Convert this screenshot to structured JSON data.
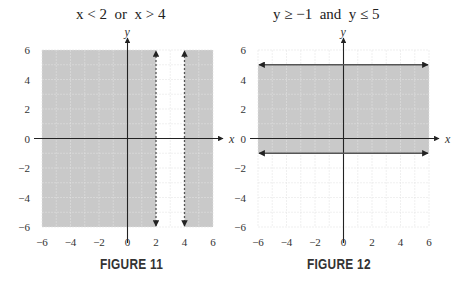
{
  "figures": [
    {
      "label": "FIGURE 11",
      "title": "x < 2  or  x > 4",
      "x_axis_label": "x",
      "y_axis_label": "y"
    },
    {
      "label": "FIGURE 12",
      "title": "y ≥ −1  and  y ≤ 5",
      "x_axis_label": "x",
      "y_axis_label": "y"
    }
  ],
  "tick_labels": {
    "x": [
      "−6",
      "−4",
      "−2",
      "0",
      "2",
      "4",
      "6"
    ],
    "y": [
      "6",
      "4",
      "2",
      "0",
      "−2",
      "−4",
      "−6"
    ]
  },
  "colors": {
    "shade": "#c9c9c9",
    "grid": "#e4e4e4",
    "axis": "#222222",
    "boundary": "#555555"
  },
  "chart_data": [
    {
      "type": "region",
      "title": "x < 2 or x > 4",
      "caption": "FIGURE 11",
      "xlabel": "x",
      "ylabel": "y",
      "xlim": [
        -6,
        6
      ],
      "ylim": [
        -6,
        6
      ],
      "xticks": [
        -6,
        -4,
        -2,
        0,
        2,
        4,
        6
      ],
      "yticks": [
        -6,
        -4,
        -2,
        0,
        2,
        4,
        6
      ],
      "grid": true,
      "shaded_regions": [
        {
          "x": [
            -6,
            2
          ],
          "y": [
            -6,
            6
          ]
        },
        {
          "x": [
            4,
            6
          ],
          "y": [
            -6,
            6
          ]
        }
      ],
      "boundaries": [
        {
          "type": "vertical",
          "x": 2,
          "style": "dashed"
        },
        {
          "type": "vertical",
          "x": 4,
          "style": "dashed"
        }
      ]
    },
    {
      "type": "region",
      "title": "y ≥ −1 and y ≤ 5",
      "caption": "FIGURE 12",
      "xlabel": "x",
      "ylabel": "y",
      "xlim": [
        -6,
        6
      ],
      "ylim": [
        -6,
        6
      ],
      "xticks": [
        -6,
        -4,
        -2,
        0,
        2,
        4,
        6
      ],
      "yticks": [
        -6,
        -4,
        -2,
        0,
        2,
        4,
        6
      ],
      "grid": true,
      "shaded_regions": [
        {
          "x": [
            -6,
            6
          ],
          "y": [
            -1,
            5
          ]
        }
      ],
      "boundaries": [
        {
          "type": "horizontal",
          "y": -1,
          "style": "solid"
        },
        {
          "type": "horizontal",
          "y": 5,
          "style": "solid"
        }
      ]
    }
  ]
}
